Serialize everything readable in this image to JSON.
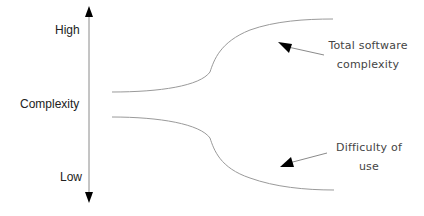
{
  "axis": {
    "title": "Complexity",
    "high_label": "High",
    "low_label": "Low"
  },
  "curves": [
    {
      "name": "total-software-complexity",
      "label_line1": "Total software",
      "label_line2": "complexity"
    },
    {
      "name": "difficulty-of-use",
      "label_line1": "Difficulty of",
      "label_line2": "use"
    }
  ],
  "colors": {
    "axis": "#888888",
    "curve": "#9a9a9a",
    "arrowhead": "#000000",
    "text": "#222222"
  }
}
